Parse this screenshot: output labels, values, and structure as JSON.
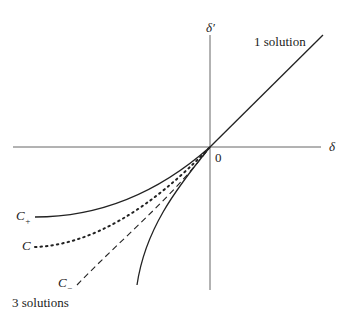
{
  "axes": {
    "x_label": "δ",
    "y_label": "δ′",
    "origin_label": "0"
  },
  "annotations": {
    "top_right": "1 solution",
    "bottom_left": "3 solutions"
  },
  "curves": [
    {
      "name": "C",
      "sub": "+",
      "style": "solid"
    },
    {
      "name": "C",
      "sub": "",
      "style": "dotted"
    },
    {
      "name": "C",
      "sub": "−",
      "style": "dashed"
    }
  ],
  "colors": {
    "ink": "#222222",
    "axis": "#555555"
  }
}
